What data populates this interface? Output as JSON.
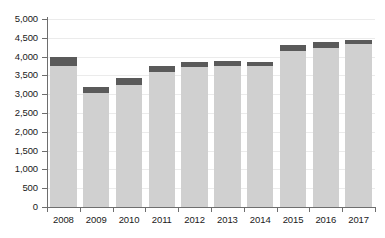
{
  "chart_data": {
    "type": "bar",
    "stacked": true,
    "title": "",
    "subtitle": "",
    "xlabel": "",
    "ylabel": "",
    "categories": [
      "2008",
      "2009",
      "2010",
      "2011",
      "2012",
      "2013",
      "2014",
      "2015",
      "2016",
      "2017"
    ],
    "series": [
      {
        "name": "base",
        "color": "#d0d0d0",
        "values": [
          3740,
          3040,
          3240,
          3580,
          3720,
          3760,
          3750,
          4150,
          4240,
          4330
        ]
      },
      {
        "name": "top",
        "color": "#5a5a5a",
        "values": [
          260,
          160,
          190,
          180,
          130,
          120,
          120,
          150,
          150,
          110
        ]
      }
    ],
    "totals": [
      4000,
      3200,
      3430,
      3760,
      3850,
      3880,
      3870,
      4300,
      4390,
      4440
    ],
    "ylim": [
      0,
      5000
    ],
    "ytick_step": 500,
    "ytick_labels": [
      "0",
      "500",
      "1,000",
      "1,500",
      "2,000",
      "2,500",
      "3,000",
      "3,500",
      "4,000",
      "4,500",
      "5,000"
    ],
    "ytick_values": [
      0,
      500,
      1000,
      1500,
      2000,
      2500,
      3000,
      3500,
      4000,
      4500,
      5000
    ],
    "grid": true,
    "legend": null,
    "legend_position": "none",
    "annotations": []
  },
  "colors": {
    "bar_base": "#d0d0d0",
    "bar_top": "#5a5a5a",
    "gridline": "#ebebeb",
    "axis": "#6e6e6e",
    "text": "#1a1a1a",
    "background": "#ffffff"
  }
}
